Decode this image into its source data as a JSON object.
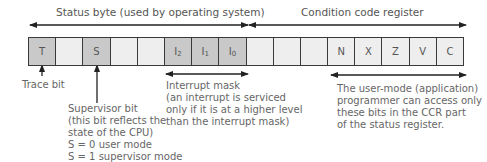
{
  "diagram": {
    "headers": {
      "status_byte": "Status byte (used by operating system)",
      "ccr": "Condition code register"
    },
    "cells": [
      {
        "label": "T",
        "sub": "",
        "shaded": true
      },
      {
        "label": "",
        "sub": "",
        "shaded": false
      },
      {
        "label": "S",
        "sub": "",
        "shaded": true
      },
      {
        "label": "",
        "sub": "",
        "shaded": false
      },
      {
        "label": "",
        "sub": "",
        "shaded": false
      },
      {
        "label": "I",
        "sub": "2",
        "shaded": true
      },
      {
        "label": "I",
        "sub": "1",
        "shaded": true
      },
      {
        "label": "I",
        "sub": "0",
        "shaded": true
      },
      {
        "label": "",
        "sub": "",
        "shaded": false
      },
      {
        "label": "",
        "sub": "",
        "shaded": false
      },
      {
        "label": "",
        "sub": "",
        "shaded": false
      },
      {
        "label": "N",
        "sub": "",
        "shaded": false
      },
      {
        "label": "X",
        "sub": "",
        "shaded": false
      },
      {
        "label": "Z",
        "sub": "",
        "shaded": false
      },
      {
        "label": "V",
        "sub": "",
        "shaded": false
      },
      {
        "label": "C",
        "sub": "",
        "shaded": false
      }
    ],
    "annotations": {
      "trace": "Trace bit",
      "supervisor": [
        "Supervisor bit",
        "(this bit reflects the",
        "state of the CPU)",
        "S = 0 user mode",
        "S = 1 supervisor mode"
      ],
      "interrupt": [
        "Interrupt mask",
        "(an interrupt is serviced",
        "only if it is at a higher level",
        "than the interrupt mask)"
      ],
      "user_mode": [
        "The user-mode (application)",
        "programmer can access only",
        "these bits in the CCR part",
        "of the status register."
      ]
    },
    "colors": {
      "shaded_cell": "#c9c9c9",
      "light_cell": "#eeeeee",
      "border": "#3a3a3a",
      "text": "#5f5f5f"
    }
  }
}
